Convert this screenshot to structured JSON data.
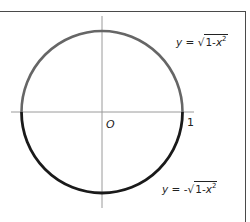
{
  "diagram": {
    "origin_label": "O",
    "x_intercept_label": "1",
    "upper_curve": {
      "lhs": "y",
      "equals": " = ",
      "sign": "",
      "radical": "√",
      "radicand_prefix": "1-",
      "radicand_var": "x",
      "exponent": "2",
      "color": "#666666"
    },
    "lower_curve": {
      "lhs": "y",
      "equals": " = ",
      "sign": "-",
      "radical": "√",
      "radicand_prefix": "1-",
      "radicand_var": "x",
      "exponent": "2",
      "color": "#1a1a1a"
    },
    "axis_color": "#9a9a9a",
    "frame_color": "#4a4a4a"
  }
}
